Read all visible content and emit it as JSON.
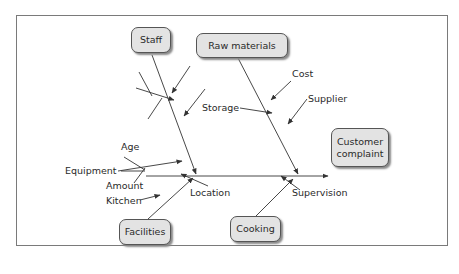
{
  "diagram": {
    "type": "fishbone (Ishikawa) cause-and-effect diagram",
    "effect": "Customer complaint",
    "categories": {
      "staff": {
        "label": "Staff",
        "causes": []
      },
      "raw_materials": {
        "label": "Raw materials",
        "causes": [
          "Cost",
          "Storage",
          "Supplier"
        ]
      },
      "facilities": {
        "label": "Facilities",
        "causes": [
          "Age",
          "Equipment",
          "Amount",
          "Kitchen",
          "Location"
        ]
      },
      "cooking": {
        "label": "Cooking",
        "causes": [
          "Supervision"
        ]
      }
    },
    "effect_lines": [
      "Customer",
      "complaint"
    ]
  },
  "colors": {
    "box_fill": "#e3e3e3",
    "box_border": "#555555",
    "line": "#333333",
    "frame": "#7a7a7a"
  }
}
